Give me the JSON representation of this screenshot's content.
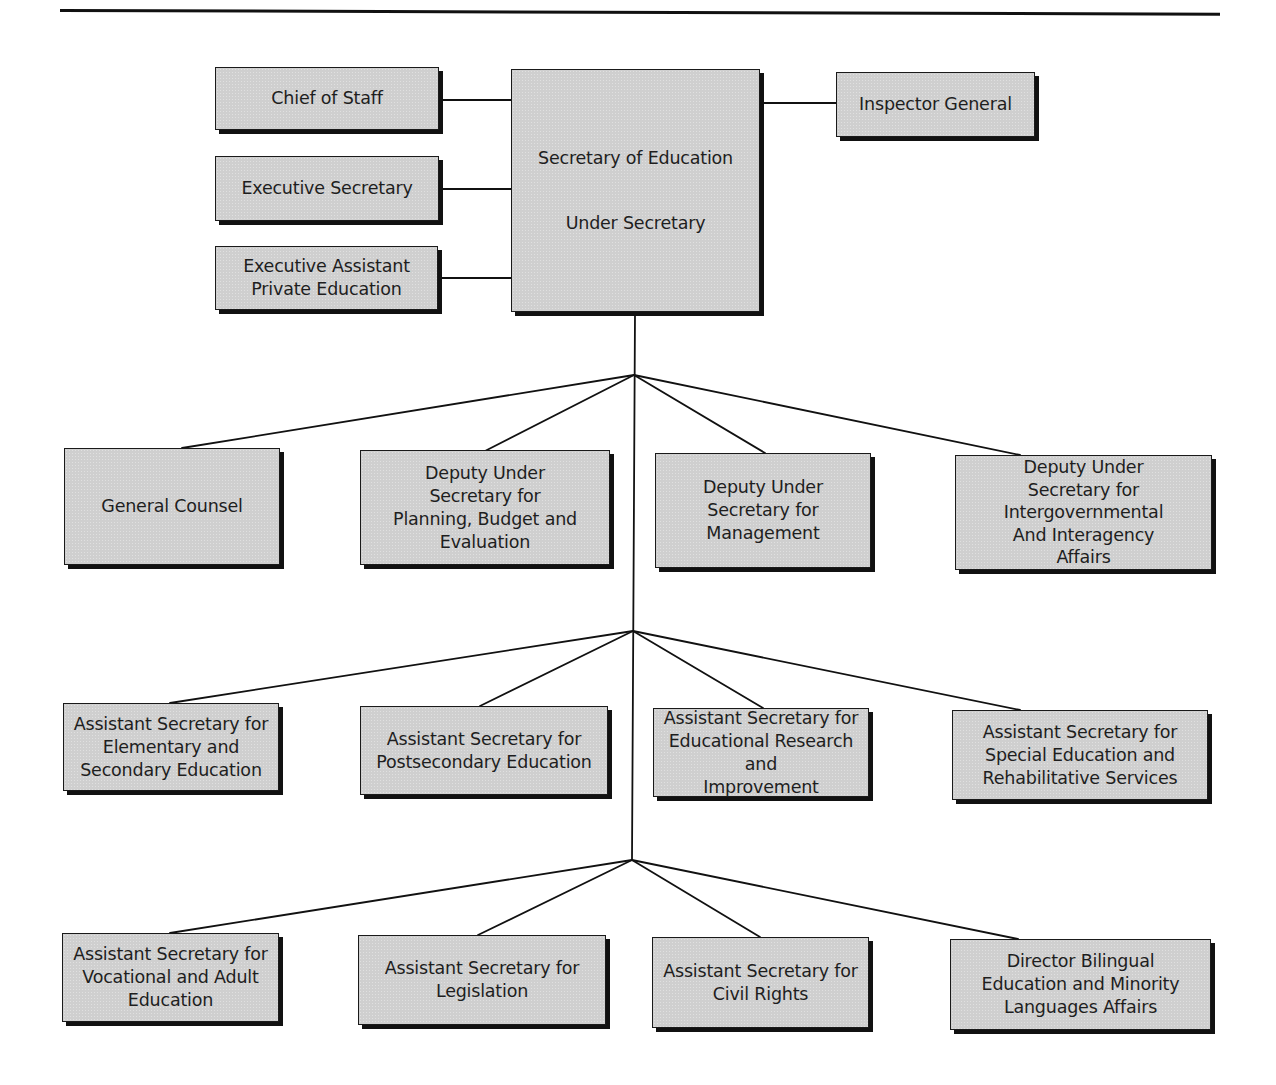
{
  "diagram": {
    "type": "organization-chart",
    "colors": {
      "box_fill": "#cfcfcf",
      "box_border": "#1a1a1a",
      "shadow": "#111111",
      "line": "#111111",
      "text": "#1e1e1e",
      "background": "#ffffff"
    },
    "head": {
      "title": "Secretary of Education",
      "subtitle": "Under Secretary"
    },
    "staff_left": [
      {
        "label": "Chief of Staff"
      },
      {
        "label": "Executive Secretary"
      },
      {
        "label": "Executive Assistant\nPrivate Education"
      }
    ],
    "staff_right": [
      {
        "label": "Inspector General"
      }
    ],
    "tiers": [
      {
        "name": "Deputy level",
        "units": [
          {
            "label": "General Counsel"
          },
          {
            "label": "Deputy Under\nSecretary for\nPlanning, Budget and\nEvaluation"
          },
          {
            "label": "Deputy Under\nSecretary for\nManagement"
          },
          {
            "label": "Deputy Under\nSecretary for\nIntergovernmental\nAnd Interagency\nAffairs"
          }
        ]
      },
      {
        "name": "Assistant Secretary level A",
        "units": [
          {
            "label": "Assistant Secretary for\nElementary and\nSecondary Education"
          },
          {
            "label": "Assistant Secretary for\nPostsecondary Education"
          },
          {
            "label": "Assistant Secretary for\nEducational Research and\nImprovement"
          },
          {
            "label": "Assistant Secretary for\nSpecial Education and\nRehabilitative Services"
          }
        ]
      },
      {
        "name": "Assistant Secretary level B",
        "units": [
          {
            "label": "Assistant Secretary for\nVocational and Adult\nEducation"
          },
          {
            "label": "Assistant Secretary for\nLegislation"
          },
          {
            "label": "Assistant Secretary for\nCivil Rights"
          },
          {
            "label": "Director Bilingual\nEducation and Minority\nLanguages Affairs"
          }
        ]
      }
    ]
  }
}
